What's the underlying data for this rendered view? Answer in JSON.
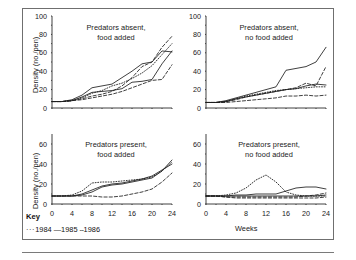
{
  "figure": {
    "axis_y_label": "Density (no./pen)",
    "axis_x_label": "Weeks",
    "key_label": "Key",
    "key_entries": [
      {
        "year": "1984",
        "style": "dotted",
        "marker": "···"
      },
      {
        "year": "1985",
        "style": "solid",
        "marker": "—"
      },
      {
        "year": "1986",
        "style": "dashed",
        "marker": "--"
      }
    ],
    "key_text": "1984  1985  1986"
  },
  "chart_data": [
    {
      "id": "predators-absent-food-added",
      "type": "line",
      "title": "Predators absent,\nfood added",
      "title_line1": "Predators absent,",
      "title_line2": "food added",
      "xlabel": "",
      "ylabel": "Density (no./pen)",
      "xlim": [
        0,
        24
      ],
      "ylim": [
        0,
        100
      ],
      "xticks": [
        0,
        4,
        8,
        12,
        16,
        20,
        24
      ],
      "yticks": [
        0,
        20,
        40,
        60,
        80,
        100
      ],
      "grid": false,
      "x": [
        0,
        2,
        4,
        6,
        8,
        10,
        12,
        14,
        16,
        18,
        20,
        22,
        24
      ],
      "series": [
        {
          "name": "1984",
          "style": "dotted",
          "values": [
            7,
            7,
            8,
            11,
            16,
            19,
            24,
            27,
            32,
            38,
            46,
            58,
            70
          ]
        },
        {
          "name": "1985",
          "style": "solid",
          "values": [
            7,
            7,
            9,
            14,
            22,
            24,
            26,
            33,
            40,
            48,
            50,
            62,
            61
          ]
        },
        {
          "name": "1986",
          "style": "dashed",
          "values": [
            7,
            7,
            8,
            10,
            13,
            15,
            18,
            24,
            33,
            45,
            50,
            66,
            78
          ]
        },
        {
          "name": "1985b",
          "style": "solid",
          "values": [
            7,
            7,
            8,
            12,
            17,
            18,
            19,
            21,
            28,
            29,
            31,
            48,
            62
          ]
        },
        {
          "name": "1986b",
          "style": "dashed",
          "values": [
            7,
            7,
            8,
            9,
            11,
            13,
            15,
            18,
            22,
            26,
            30,
            31,
            47
          ]
        }
      ]
    },
    {
      "id": "predators-absent-no-food-added",
      "type": "line",
      "title": "Predators absent,\nno food added",
      "title_line1": "Predators absent,",
      "title_line2": "no food added",
      "xlabel": "",
      "ylabel": "",
      "xlim": [
        0,
        24
      ],
      "ylim": [
        0,
        100
      ],
      "xticks": [
        0,
        4,
        8,
        12,
        16,
        20,
        24
      ],
      "yticks": [
        0,
        20,
        40,
        60,
        80,
        100
      ],
      "grid": false,
      "x": [
        0,
        2,
        4,
        6,
        8,
        10,
        12,
        14,
        16,
        18,
        20,
        22,
        24
      ],
      "series": [
        {
          "name": "1984",
          "style": "dotted",
          "values": [
            6,
            6,
            7,
            10,
            13,
            15,
            17,
            19,
            20,
            21,
            22,
            23,
            23
          ]
        },
        {
          "name": "1985",
          "style": "solid",
          "values": [
            6,
            6,
            8,
            11,
            14,
            17,
            20,
            23,
            41,
            43,
            45,
            50,
            66
          ]
        },
        {
          "name": "1986",
          "style": "dashed",
          "values": [
            6,
            6,
            7,
            9,
            12,
            14,
            16,
            18,
            20,
            22,
            27,
            24,
            45
          ]
        },
        {
          "name": "1985b",
          "style": "solid",
          "values": [
            6,
            6,
            7,
            10,
            12,
            14,
            16,
            18,
            20,
            21,
            24,
            26,
            25
          ]
        },
        {
          "name": "1986b",
          "style": "dashed",
          "values": [
            6,
            6,
            6,
            7,
            8,
            9,
            10,
            11,
            13,
            13,
            14,
            13,
            14
          ]
        }
      ]
    },
    {
      "id": "predators-present-food-added",
      "type": "line",
      "title": "Predators present,\nfood added",
      "title_line1": "Predators present,",
      "title_line2": "food added",
      "xlabel": "Weeks",
      "ylabel": "Density (no./pen)",
      "xlim": [
        0,
        24
      ],
      "ylim": [
        0,
        70
      ],
      "xticks": [
        0,
        4,
        8,
        12,
        16,
        20,
        24
      ],
      "yticks": [
        0,
        20,
        40,
        60
      ],
      "grid": false,
      "x": [
        0,
        2,
        4,
        6,
        8,
        10,
        12,
        14,
        16,
        18,
        20,
        22,
        24
      ],
      "series": [
        {
          "name": "1984",
          "style": "dotted",
          "values": [
            8,
            8,
            9,
            13,
            21,
            22,
            22,
            23,
            24,
            25,
            27,
            33,
            42
          ]
        },
        {
          "name": "1985",
          "style": "solid",
          "values": [
            8,
            8,
            8,
            9,
            12,
            17,
            19,
            20,
            22,
            24,
            26,
            33,
            44
          ]
        },
        {
          "name": "1986",
          "style": "dashed",
          "values": [
            8,
            8,
            8,
            8,
            8,
            7,
            7,
            8,
            10,
            12,
            15,
            22,
            31
          ]
        },
        {
          "name": "1985b",
          "style": "solid",
          "values": [
            8,
            8,
            8,
            10,
            14,
            18,
            20,
            21,
            23,
            25,
            28,
            34,
            40
          ]
        }
      ]
    },
    {
      "id": "predators-present-no-food-added",
      "type": "line",
      "title": "Predators present,\nno food added",
      "title_line1": "Predators present,",
      "title_line2": "no food added",
      "xlabel": "Weeks",
      "ylabel": "",
      "xlim": [
        0,
        24
      ],
      "ylim": [
        0,
        70
      ],
      "xticks": [
        0,
        4,
        8,
        12,
        16,
        20,
        24
      ],
      "yticks": [
        0,
        20,
        40,
        60
      ],
      "grid": false,
      "x": [
        0,
        2,
        4,
        6,
        8,
        10,
        12,
        14,
        16,
        18,
        20,
        22,
        24
      ],
      "series": [
        {
          "name": "1984",
          "style": "dotted",
          "values": [
            8,
            8,
            9,
            11,
            16,
            24,
            29,
            22,
            12,
            9,
            8,
            8,
            8
          ]
        },
        {
          "name": "1985",
          "style": "solid",
          "values": [
            8,
            8,
            8,
            9,
            9,
            10,
            10,
            10,
            13,
            16,
            17,
            17,
            15
          ]
        },
        {
          "name": "1986",
          "style": "dashed",
          "values": [
            8,
            8,
            7,
            7,
            7,
            7,
            7,
            7,
            7,
            7,
            8,
            9,
            11
          ]
        },
        {
          "name": "1985b",
          "style": "solid",
          "values": [
            8,
            8,
            8,
            8,
            8,
            8,
            8,
            8,
            8,
            8,
            8,
            8,
            9
          ]
        },
        {
          "name": "1986b",
          "style": "dashed",
          "values": [
            8,
            8,
            7,
            6,
            6,
            6,
            6,
            6,
            6,
            6,
            6,
            6,
            7
          ]
        }
      ]
    }
  ]
}
